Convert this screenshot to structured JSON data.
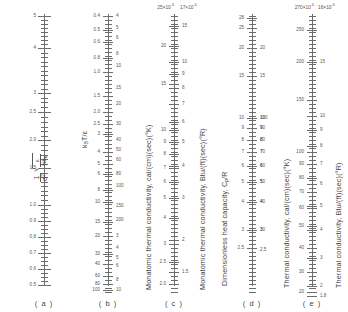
{
  "figure": {
    "type": "nomograph",
    "panel_count": 5
  },
  "chart_data": {
    "type": "line",
    "xlabel": "",
    "ylabel": "",
    "grid": false,
    "legend": "none",
    "panels": [
      {
        "letter": "( a )",
        "caption_left": "1 / ( σ² √(ε/Nk_B) )",
        "scale": "logarithmic",
        "orientation": "descending",
        "header_left": "",
        "header_right": "",
        "labels_left": [
          "5",
          "4",
          "3",
          "2.5",
          "2.0",
          "1.5",
          "1.0",
          "0.9",
          "0.8",
          "0.7",
          "0.6",
          "0.5"
        ],
        "labels_right": []
      },
      {
        "letter": "( b )",
        "caption_left": "k_B T / ε",
        "scale": "logarithmic",
        "orientation": "descending",
        "header_left": "",
        "header_right": "",
        "labels_left": [
          "0.4",
          "0.5",
          "0.6",
          "0.8",
          "1.0",
          "1.5",
          "2.0",
          "2.5",
          "3",
          "4",
          "5",
          "6",
          "8",
          "10",
          "15",
          "20",
          "30",
          "40",
          "60",
          "80",
          "100",
          "200"
        ],
        "labels_right": [
          "4",
          "5",
          "6",
          "8",
          "10",
          "15",
          "20",
          "30",
          "40",
          "50",
          "60",
          "80",
          "100",
          "150",
          "200",
          "3",
          "4",
          "5",
          "6",
          "7",
          "8",
          "9",
          "10",
          "15",
          "2",
          "3",
          "4",
          "5",
          "6"
        ]
      },
      {
        "letter": "( c )",
        "caption_left": "Monatomic thermal conductivity, cal/(cm)(sec)(°K)",
        "caption_right": "Monatomic thermal conductivity, Btu/(ft)(sec)(°R)",
        "scale": "logarithmic",
        "orientation": "descending",
        "header_left": "25×10",
        "header_left_exp": "-6",
        "header_right": "17×10",
        "header_right_exp": "-6",
        "labels_left": [
          "20",
          "15",
          "10",
          "9",
          "8",
          "7",
          "6",
          "5",
          "4",
          "3",
          "2.5",
          "2.0"
        ],
        "labels_right": [
          "15",
          "4",
          "3",
          "2",
          "10",
          "9",
          "8",
          "7",
          "6",
          "5",
          "4",
          "3",
          "2",
          "1.5"
        ]
      },
      {
        "letter": "( d )",
        "caption_left": "Dimensionless heat capacity, C_p/R",
        "scale": "logarithmic",
        "orientation": "descending",
        "header_left": "",
        "header_right": "",
        "labels_left": [
          "28",
          "25",
          "20",
          "15",
          "10",
          "9",
          "8",
          "7",
          "6",
          "5",
          "4",
          "3",
          "2.5"
        ],
        "labels_right": [
          "100",
          "90",
          "80",
          "70",
          "60",
          "50",
          "40",
          "30",
          "20",
          "15",
          "10",
          "9",
          "8",
          "7",
          "6",
          "5",
          "4",
          "3",
          "2.5"
        ]
      },
      {
        "letter": "( e )",
        "caption_left": "Thermal conductivity, cal/(cm)(sec)(°K)",
        "caption_right": "Thermal conductivity, Btu/(ft)(sec)(°R)",
        "scale": "logarithmic",
        "orientation": "descending",
        "header_left": "270×10",
        "header_left_exp": "-6",
        "header_right": "16×10",
        "header_right_exp": "-6",
        "labels_left": [
          "250",
          "200",
          "150",
          "100",
          "90",
          "80",
          "70",
          "60",
          "50",
          "40",
          "30",
          "20"
        ],
        "labels_right": [
          "15",
          "10",
          "9",
          "8",
          "7",
          "6",
          "5",
          "4",
          "3",
          "2",
          "1.8"
        ]
      }
    ]
  },
  "panel_a": {
    "letter": "( a )",
    "formula": {
      "numerator": "1",
      "denom_sigma": "σ",
      "denom_sigma_exp": "2",
      "radicand_over": "ε",
      "radicand_under": "Nk",
      "radicand_under_sub": "B"
    },
    "ticks": [
      {
        "v": "5",
        "y": 16,
        "k": "major"
      },
      {
        "v": "",
        "y": 24,
        "k": "minor"
      },
      {
        "v": "",
        "y": 32,
        "k": "minor"
      },
      {
        "v": "",
        "y": 40,
        "k": "minor"
      },
      {
        "v": "4",
        "y": 48,
        "k": "major"
      },
      {
        "v": "",
        "y": 57,
        "k": "minor"
      },
      {
        "v": "",
        "y": 66,
        "k": "minor"
      },
      {
        "v": "",
        "y": 75,
        "k": "minor"
      },
      {
        "v": "",
        "y": 84,
        "k": "minor"
      },
      {
        "v": "3",
        "y": 93,
        "k": "major"
      },
      {
        "v": "",
        "y": 102,
        "k": "minor"
      },
      {
        "v": "2.5",
        "y": 112,
        "k": "major"
      },
      {
        "v": "",
        "y": 122,
        "k": "minor"
      },
      {
        "v": "",
        "y": 131,
        "k": "minor"
      },
      {
        "v": "2.0",
        "y": 140,
        "k": "major"
      },
      {
        "v": "",
        "y": 150,
        "k": "minor"
      },
      {
        "v": "",
        "y": 159,
        "k": "minor"
      },
      {
        "v": "1.5",
        "y": 168,
        "k": "major"
      },
      {
        "v": "",
        "y": 177,
        "k": "minor"
      },
      {
        "v": "",
        "y": 186,
        "k": "minor"
      },
      {
        "v": "",
        "y": 195,
        "k": "minor"
      },
      {
        "v": "1.0",
        "y": 205,
        "k": "major"
      },
      {
        "v": "",
        "y": 213,
        "k": "minor"
      },
      {
        "v": "0.9",
        "y": 221,
        "k": "major"
      },
      {
        "v": "",
        "y": 229,
        "k": "minor"
      },
      {
        "v": "0.8",
        "y": 237,
        "k": "major"
      },
      {
        "v": "",
        "y": 245,
        "k": "minor"
      },
      {
        "v": "0.7",
        "y": 253,
        "k": "major"
      },
      {
        "v": "",
        "y": 261,
        "k": "minor"
      },
      {
        "v": "0.6",
        "y": 269,
        "k": "major"
      },
      {
        "v": "",
        "y": 277,
        "k": "minor"
      },
      {
        "v": "0.5",
        "y": 285,
        "k": "major"
      }
    ]
  },
  "panel_b": {
    "letter": "( b )",
    "caption": "k",
    "caption_sub": "B",
    "caption_rest": "T/ε",
    "ticks_left": [
      {
        "v": "0.4",
        "y": 16
      },
      {
        "v": "0.5",
        "y": 30
      },
      {
        "v": "0.6",
        "y": 42
      },
      {
        "v": "0.8",
        "y": 58
      },
      {
        "v": "1.0",
        "y": 72
      },
      {
        "v": "1.5",
        "y": 96
      },
      {
        "v": "2.0",
        "y": 112
      },
      {
        "v": "2.5",
        "y": 124
      },
      {
        "v": "3",
        "y": 134
      },
      {
        "v": "4",
        "y": 152
      },
      {
        "v": "5",
        "y": 164
      },
      {
        "v": "6",
        "y": 174
      },
      {
        "v": "8",
        "y": 190
      },
      {
        "v": "10",
        "y": 202
      },
      {
        "v": "15",
        "y": 222
      },
      {
        "v": "20",
        "y": 236
      },
      {
        "v": "30",
        "y": 254
      },
      {
        "v": "40",
        "y": 264
      },
      {
        "v": "60",
        "y": 276
      },
      {
        "v": "80",
        "y": 284
      },
      {
        "v": "100",
        "y": 290
      }
    ],
    "ticks_right": [
      {
        "v": "4",
        "y": 16
      },
      {
        "v": "5",
        "y": 28
      },
      {
        "v": "6",
        "y": 38
      },
      {
        "v": "8",
        "y": 54
      },
      {
        "v": "10",
        "y": 66
      },
      {
        "v": "15",
        "y": 88
      },
      {
        "v": "20",
        "y": 104
      },
      {
        "v": "30",
        "y": 124
      },
      {
        "v": "40",
        "y": 140
      },
      {
        "v": "50",
        "y": 150
      },
      {
        "v": "60",
        "y": 160
      },
      {
        "v": "80",
        "y": 174
      },
      {
        "v": "100",
        "y": 186
      },
      {
        "v": "150",
        "y": 206
      },
      {
        "v": "200",
        "y": 220
      },
      {
        "v": "3",
        "y": 236
      },
      {
        "v": "4",
        "y": 248
      },
      {
        "v": "5",
        "y": 258
      },
      {
        "v": "6",
        "y": 266
      },
      {
        "v": "8",
        "y": 280
      },
      {
        "v": "10",
        "y": 290
      }
    ]
  },
  "panel_c": {
    "letter": "( c )",
    "caption_left": "Monatomic thermal conductivity, cal/(cm)(sec)(°K)",
    "caption_right": "Monatomic thermal conductivity, Btu/(ft)(sec)(°R)",
    "header_left": "25×10",
    "header_left_exp": "-6",
    "header_right": "17×10",
    "header_right_exp": "-6",
    "ticks_left": [
      {
        "v": "20",
        "y": 46
      },
      {
        "v": "15",
        "y": 84
      },
      {
        "v": "10",
        "y": 130
      },
      {
        "v": "9",
        "y": 142
      },
      {
        "v": "8",
        "y": 154
      },
      {
        "v": "7",
        "y": 168
      },
      {
        "v": "6",
        "y": 182
      },
      {
        "v": "5",
        "y": 198
      },
      {
        "v": "4",
        "y": 218
      },
      {
        "v": "3",
        "y": 244
      },
      {
        "v": "2.5",
        "y": 262
      },
      {
        "v": "2.0",
        "y": 284
      }
    ],
    "ticks_right": [
      {
        "v": "15",
        "y": 26
      },
      {
        "v": "10",
        "y": 62
      },
      {
        "v": "9",
        "y": 74
      },
      {
        "v": "8",
        "y": 88
      },
      {
        "v": "7",
        "y": 104
      },
      {
        "v": "6",
        "y": 122
      },
      {
        "v": "5",
        "y": 142
      },
      {
        "v": "4",
        "y": 166
      },
      {
        "v": "3",
        "y": 198
      },
      {
        "v": "2",
        "y": 240
      },
      {
        "v": "1.5",
        "y": 272
      }
    ]
  },
  "panel_d": {
    "letter": "( d )",
    "caption": "Dimensionless heat capacity, C",
    "caption_sub": "p",
    "caption_rest": "/R",
    "ticks_left": [
      {
        "v": "28",
        "y": 18
      },
      {
        "v": "25",
        "y": 28
      },
      {
        "v": "20",
        "y": 48
      },
      {
        "v": "15",
        "y": 76
      },
      {
        "v": "10",
        "y": 118
      },
      {
        "v": "9",
        "y": 128
      },
      {
        "v": "8",
        "y": 140
      },
      {
        "v": "7",
        "y": 152
      },
      {
        "v": "6",
        "y": 166
      },
      {
        "v": "5",
        "y": 182
      },
      {
        "v": "4",
        "y": 202
      },
      {
        "v": "3",
        "y": 230
      },
      {
        "v": "2.5",
        "y": 248
      }
    ],
    "ticks_right": [
      {
        "v": "100",
        "y": 118
      },
      {
        "v": "90",
        "y": 128
      },
      {
        "v": "80",
        "y": 140
      },
      {
        "v": "70",
        "y": 152
      },
      {
        "v": "60",
        "y": 166
      },
      {
        "v": "50",
        "y": 182
      },
      {
        "v": "40",
        "y": 202
      },
      {
        "v": "30",
        "y": 230
      },
      {
        "v": "20",
        "y": 48
      },
      {
        "v": "15",
        "y": 76
      },
      {
        "v": "10",
        "y": 118
      },
      {
        "v": "9",
        "y": 128
      },
      {
        "v": "8",
        "y": 140
      },
      {
        "v": "7",
        "y": 152
      },
      {
        "v": "6",
        "y": 166
      },
      {
        "v": "5",
        "y": 182
      },
      {
        "v": "4",
        "y": 202
      },
      {
        "v": "3",
        "y": 230
      },
      {
        "v": "2.5",
        "y": 250
      }
    ]
  },
  "panel_e": {
    "letter": "( e )",
    "caption_left": "Thermal conductivity, cal/(cm)(sec)(°K)",
    "caption_right": "Thermal conductivity, Btu/(ft)(sec)(°R)",
    "header_left": "270×10",
    "header_left_exp": "-6",
    "header_right": "16×10",
    "header_right_exp": "-6",
    "ticks_left": [
      {
        "v": "250",
        "y": 30
      },
      {
        "v": "200",
        "y": 62
      },
      {
        "v": "150",
        "y": 100
      },
      {
        "v": "100",
        "y": 152
      },
      {
        "v": "90",
        "y": 164
      },
      {
        "v": "80",
        "y": 178
      },
      {
        "v": "70",
        "y": 192
      },
      {
        "v": "60",
        "y": 208
      },
      {
        "v": "50",
        "y": 226
      },
      {
        "v": "40",
        "y": 248
      },
      {
        "v": "30",
        "y": 272
      },
      {
        "v": "20",
        "y": 292
      }
    ],
    "ticks_right": [
      {
        "v": "15",
        "y": 62
      },
      {
        "v": "10",
        "y": 116
      },
      {
        "v": "9",
        "y": 130
      },
      {
        "v": "8",
        "y": 146
      },
      {
        "v": "7",
        "y": 164
      },
      {
        "v": "6",
        "y": 184
      },
      {
        "v": "5",
        "y": 206
      },
      {
        "v": "4",
        "y": 230
      },
      {
        "v": "3",
        "y": 258
      },
      {
        "v": "2",
        "y": 286
      },
      {
        "v": "1.8",
        "y": 296
      }
    ]
  }
}
